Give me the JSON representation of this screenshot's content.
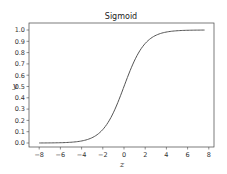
{
  "chart_data": {
    "type": "line",
    "title": "Sigmoid",
    "xlabel": "z",
    "ylabel": "y",
    "xlim": [
      -8.5,
      8.5
    ],
    "ylim": [
      -0.05,
      1.05
    ],
    "grid": false,
    "legend": null,
    "x_ticks": [
      -8,
      -6,
      -4,
      -2,
      0,
      2,
      4,
      6,
      8
    ],
    "x_tick_labels": [
      "-8",
      "-6",
      "-4",
      "-2",
      "0",
      "2",
      "4",
      "6",
      "8"
    ],
    "y_ticks": [
      0.0,
      0.1,
      0.2,
      0.3,
      0.4,
      0.5,
      0.6,
      0.7,
      0.8,
      0.9,
      1.0
    ],
    "y_tick_labels": [
      "0.0",
      "0.1",
      "0.2",
      "0.3",
      "0.4",
      "0.5",
      "0.6",
      "0.7",
      "0.8",
      "0.9",
      "1.0"
    ],
    "series": [
      {
        "name": "sigmoid",
        "color": "#555555",
        "function": "1/(1+exp(-z))",
        "x": [
          -8,
          -7,
          -6,
          -5,
          -4,
          -3,
          -2,
          -1,
          0,
          1,
          2,
          3,
          4,
          5,
          6,
          7,
          7.6
        ],
        "y": [
          0.0003,
          0.0009,
          0.0025,
          0.0067,
          0.018,
          0.047,
          0.119,
          0.269,
          0.5,
          0.731,
          0.881,
          0.953,
          0.982,
          0.993,
          0.998,
          0.999,
          0.9995
        ]
      }
    ]
  }
}
